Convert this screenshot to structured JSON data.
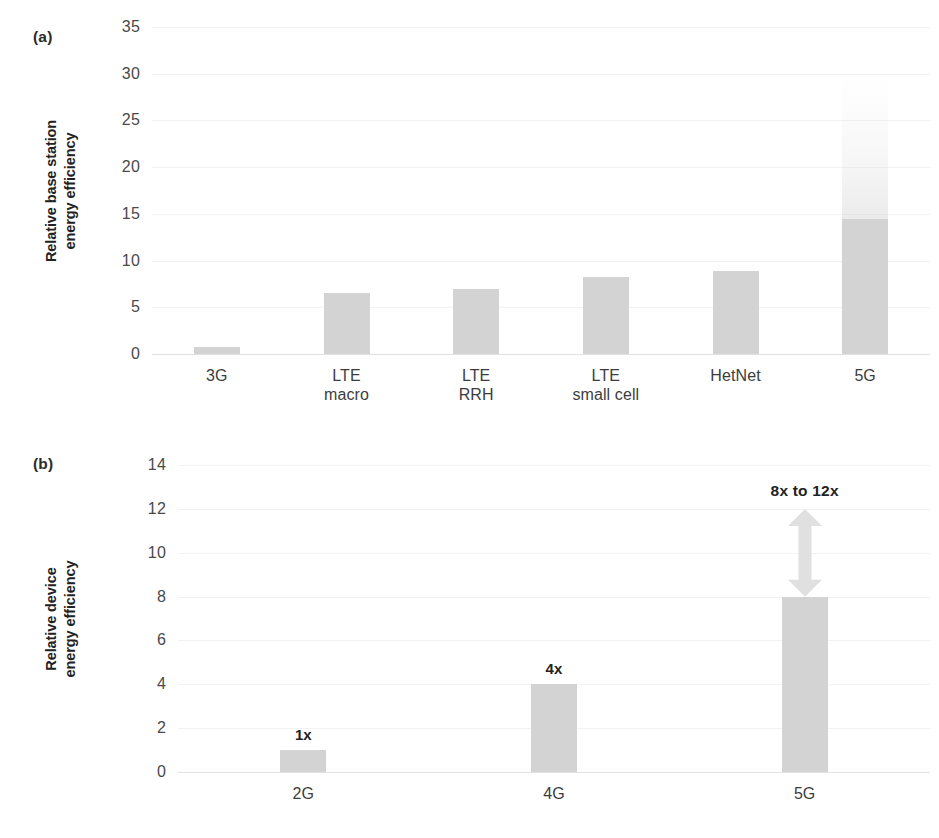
{
  "figure": {
    "background": "#ffffff",
    "bar_color": "#d3d3d3",
    "gridline_color": "#f2f2f2",
    "axis_color": "#e2e2e2",
    "text_color": "#222222"
  },
  "panels": {
    "a": {
      "tag": "(a)",
      "ylabel": "Relative base station\nenergy efficiency"
    },
    "b": {
      "tag": "(b)",
      "ylabel": "Relative device\nenergy efficiency"
    }
  },
  "chart_data": [
    {
      "id": "a",
      "type": "bar",
      "title": "",
      "panel_label": "(a)",
      "xlabel": "",
      "ylabel": "Relative base station energy efficiency",
      "ylim": [
        0,
        35
      ],
      "yticks": [
        0,
        5,
        10,
        15,
        20,
        25,
        30,
        35
      ],
      "ytick_labels": [
        "0",
        "5",
        "10",
        "15",
        "20",
        "25",
        "30",
        "35"
      ],
      "grid": true,
      "legend": false,
      "categories": [
        "3G",
        "LTE\nmacro",
        "LTE\nRRH",
        "LTE\nsmall cell",
        "HetNet",
        "5G"
      ],
      "category_labels": [
        "3G",
        "LTE macro",
        "LTE RRH",
        "LTE small cell",
        "HetNet",
        "5G"
      ],
      "values": [
        0.8,
        6.5,
        7.0,
        8.2,
        8.9,
        14.5
      ],
      "annotations": [
        {
          "target": "5G",
          "kind": "faded-extension",
          "from": 14.5,
          "to": 30,
          "note": "faded gradient continuation of the 5G bar up to about 30"
        }
      ]
    },
    {
      "id": "b",
      "type": "bar",
      "title": "",
      "panel_label": "(b)",
      "xlabel": "",
      "ylabel": "Relative device energy efficiency",
      "ylim": [
        0,
        14
      ],
      "yticks": [
        0,
        2,
        4,
        6,
        8,
        10,
        12,
        14
      ],
      "ytick_labels": [
        "0",
        "2",
        "4",
        "6",
        "8",
        "10",
        "12",
        "14"
      ],
      "grid": true,
      "legend": false,
      "categories": [
        "2G",
        "4G",
        "5G"
      ],
      "category_labels": [
        "2G",
        "4G",
        "5G"
      ],
      "values": [
        1,
        4,
        8
      ],
      "data_labels": [
        "1x",
        "4x",
        "8x to 12x"
      ],
      "annotations": [
        {
          "target": "5G",
          "kind": "double-arrow",
          "from": 8,
          "to": 12,
          "label": "8x to 12x"
        }
      ]
    }
  ],
  "panel_a": {
    "ticks": [
      {
        "label": "35",
        "value": 35
      },
      {
        "label": "30",
        "value": 30
      },
      {
        "label": "25",
        "value": 25
      },
      {
        "label": "20",
        "value": 20
      },
      {
        "label": "15",
        "value": 15
      },
      {
        "label": "10",
        "value": 10
      },
      {
        "label": "5",
        "value": 5
      },
      {
        "label": "0",
        "value": 0
      }
    ],
    "bars": [
      {
        "label": "3G",
        "value": 0.8
      },
      {
        "label": "LTE\nmacro",
        "value": 6.5
      },
      {
        "label": "LTE\nRRH",
        "value": 7.0
      },
      {
        "label": "LTE\nsmall cell",
        "value": 8.2
      },
      {
        "label": "HetNet",
        "value": 8.9
      },
      {
        "label": "5G",
        "value": 14.5
      }
    ]
  },
  "panel_b": {
    "ticks": [
      {
        "label": "14",
        "value": 14
      },
      {
        "label": "12",
        "value": 12
      },
      {
        "label": "10",
        "value": 10
      },
      {
        "label": "8",
        "value": 8
      },
      {
        "label": "6",
        "value": 6
      },
      {
        "label": "4",
        "value": 4
      },
      {
        "label": "2",
        "value": 2
      },
      {
        "label": "0",
        "value": 0
      }
    ],
    "bars": [
      {
        "label": "2G",
        "value": 1,
        "data_label": "1x"
      },
      {
        "label": "4G",
        "value": 4,
        "data_label": "4x"
      },
      {
        "label": "5G",
        "value": 8,
        "data_label": ""
      }
    ],
    "range_note": "8x to 12x"
  }
}
